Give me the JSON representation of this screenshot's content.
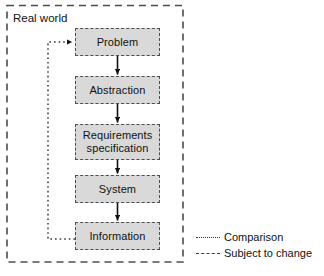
{
  "diagram": {
    "container": {
      "label": "Real world",
      "border_style": "dashed",
      "color": "#4d4d4d"
    },
    "nodes": [
      {
        "id": "problem",
        "label": "Problem",
        "x": 75,
        "y": 28,
        "w": 85,
        "h": 28
      },
      {
        "id": "abstraction",
        "label": "Abstraction",
        "x": 75,
        "y": 76,
        "w": 85,
        "h": 28
      },
      {
        "id": "requirements",
        "label": "Requirements\nspecification",
        "x": 75,
        "y": 124,
        "w": 85,
        "h": 36
      },
      {
        "id": "system",
        "label": "System",
        "x": 75,
        "y": 175,
        "w": 85,
        "h": 28
      },
      {
        "id": "information",
        "label": "Information",
        "x": 75,
        "y": 222,
        "w": 85,
        "h": 28
      }
    ],
    "flow_arrows": [
      {
        "from": "problem",
        "to": "abstraction",
        "style": "solid"
      },
      {
        "from": "abstraction",
        "to": "requirements",
        "style": "solid"
      },
      {
        "from": "requirements",
        "to": "system",
        "style": "solid"
      },
      {
        "from": "system",
        "to": "information",
        "style": "solid"
      }
    ],
    "feedback_arrow": {
      "from": "information",
      "to": "problem",
      "style": "dotted",
      "meaning": "Comparison"
    },
    "colors": {
      "node_fill": "#d9d9d9",
      "node_border": "#4d4d4d",
      "arrow": "#111111",
      "dotted": "#3a3a3a"
    }
  },
  "legend": {
    "items": [
      {
        "label": "Comparison",
        "style": "dotted"
      },
      {
        "label": "Subject to change",
        "style": "dashed"
      }
    ]
  }
}
